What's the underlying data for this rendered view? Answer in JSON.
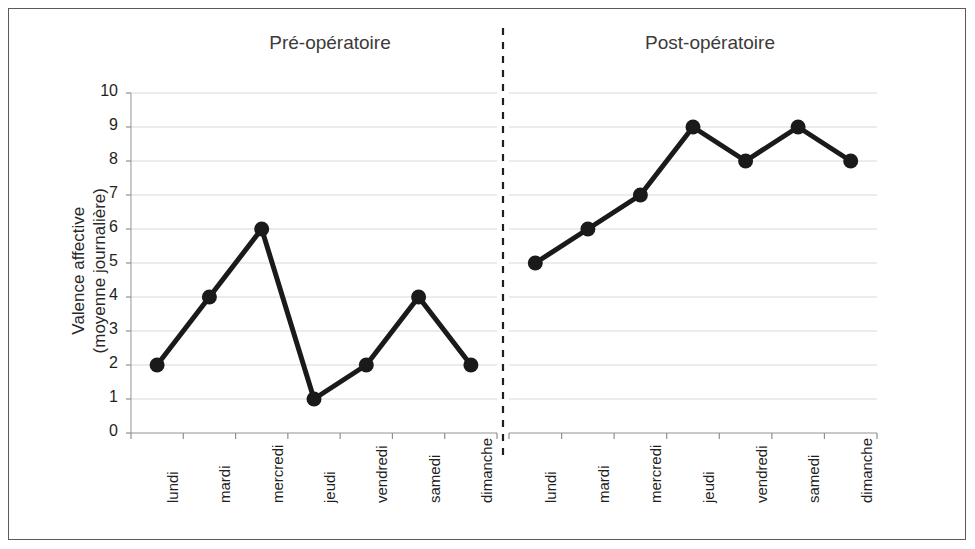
{
  "figure": {
    "border_color": "#5a5a5a",
    "background": "#ffffff"
  },
  "panels": [
    {
      "id": "pre",
      "title": "Pré-opératoire"
    },
    {
      "id": "post",
      "title": "Post-opératoire"
    }
  ],
  "axes": {
    "y_title_line1": "Valence affective",
    "y_title_line2": "(moyenne journalière)",
    "y_ticks": [
      "10",
      "9",
      "8",
      "7",
      "6",
      "5",
      "4",
      "3",
      "2",
      "1",
      "0"
    ],
    "x_categories": [
      "lundi",
      "mardi",
      "mercredi",
      "jeudi",
      "vendredi",
      "samedi",
      "dimanche"
    ]
  },
  "divider": {
    "style": "dashed",
    "color": "#1f1f1f"
  },
  "chart_data": {
    "type": "line",
    "title": "",
    "xlabel": "",
    "ylabel": "Valence affective (moyenne journalière)",
    "ylim": [
      0,
      10
    ],
    "ytick_step": 1,
    "grid": true,
    "legend": "none",
    "marker": "filled-circle",
    "line_color": "#1a1a1a",
    "categories": [
      "lundi",
      "mardi",
      "mercredi",
      "jeudi",
      "vendredi",
      "samedi",
      "dimanche"
    ],
    "panels": [
      {
        "name": "Pré-opératoire",
        "categories": [
          "lundi",
          "mardi",
          "mercredi",
          "jeudi",
          "vendredi",
          "samedi",
          "dimanche"
        ],
        "values": [
          2,
          4,
          6,
          1,
          2,
          4,
          2
        ]
      },
      {
        "name": "Post-opératoire",
        "categories": [
          "lundi",
          "mardi",
          "mercredi",
          "jeudi",
          "vendredi",
          "samedi",
          "dimanche"
        ],
        "values": [
          5,
          6,
          7,
          9,
          8,
          9,
          8
        ]
      }
    ]
  }
}
